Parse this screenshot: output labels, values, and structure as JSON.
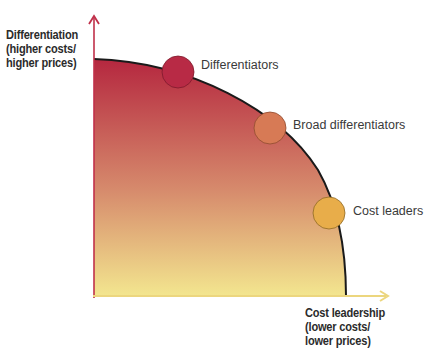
{
  "diagram": {
    "y_axis": {
      "label_lines": [
        "Differentiation",
        "(higher costs/",
        "higher prices)"
      ],
      "color": "#c0304a"
    },
    "x_axis": {
      "label_lines": [
        "Cost leadership",
        "(lower costs/",
        "lower prices)"
      ],
      "color": "#e8d27a"
    },
    "gradient": {
      "top": "#b5273f",
      "middle": "#d88a6e",
      "bottom": "#f2e48e"
    },
    "points": [
      {
        "label": "Differentiators",
        "color": "#b82a45"
      },
      {
        "label": "Broad differentiators",
        "color": "#d77a55"
      },
      {
        "label": "Cost leaders",
        "color": "#e8ad4a"
      }
    ]
  }
}
